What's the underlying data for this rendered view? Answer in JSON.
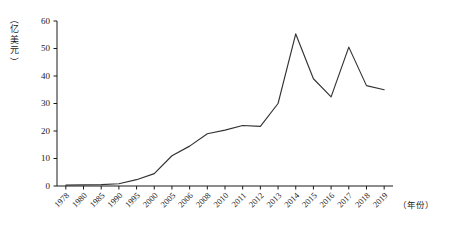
{
  "chart_data": {
    "type": "line",
    "title": "",
    "subtitle": "",
    "xlabel": "（年份）",
    "ylabel": "（亿美元）",
    "categories": [
      "1978",
      "1980",
      "1985",
      "1990",
      "1995",
      "2000",
      "2005",
      "2006",
      "2008",
      "2010",
      "2011",
      "2012",
      "2013",
      "2014",
      "2015",
      "2016",
      "2017",
      "2018",
      "2019"
    ],
    "series": [
      {
        "name": "金额",
        "values": [
          0.3,
          0.4,
          0.5,
          0.8,
          2.3,
          4.5,
          11.0,
          14.5,
          19.0,
          20.3,
          22.0,
          21.7,
          30.0,
          55.3,
          39.0,
          32.4,
          50.5,
          36.5,
          35.0
        ]
      }
    ],
    "ylim": [
      0,
      60
    ],
    "yticks": [
      0,
      10,
      20,
      30,
      40,
      50,
      60
    ],
    "ytick_labels": [
      "0",
      "10",
      "20",
      "30",
      "40",
      "50",
      "60"
    ],
    "grid": false,
    "legend": false,
    "legend_position": "none",
    "line_color": "#333333",
    "markers": false,
    "xtick_rotation": 45
  },
  "axes": {
    "y_axis_title_chars": [
      "（",
      "亿",
      "美",
      "元",
      "）"
    ],
    "x_axis_title": "（年份）"
  }
}
